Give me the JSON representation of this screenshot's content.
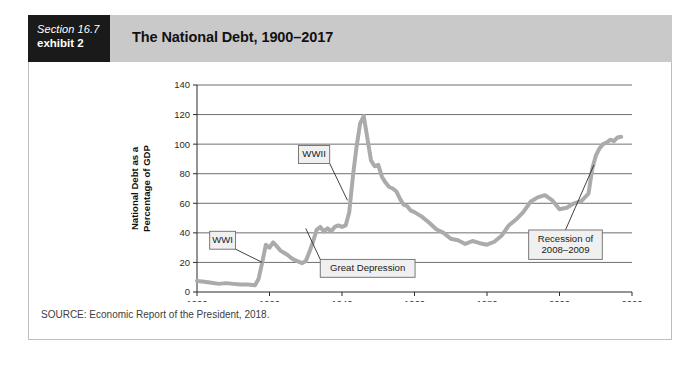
{
  "exhibit": {
    "section_label": "Section 16.7",
    "exhibit_label": "exhibit 2",
    "title": "The National Debt, 1900–2017",
    "source": "SOURCE: Economic Report of the President, 2018."
  },
  "colors": {
    "header_bar": "#c9c9c9",
    "tag_background": "#1a1a1a",
    "tag_text": "#ffffff",
    "line": "#ababab",
    "grid": "#4a4a4a",
    "callout_fill": "#f0f0f0",
    "callout_border": "#6b6b6b"
  },
  "chart_data": {
    "type": "line",
    "title": "The National Debt, 1900–2017",
    "xlabel": "",
    "ylabel": "National Debt as a Percentage of GDP",
    "ylabel_lines": [
      "National Debt as a",
      "Percentage of GDP"
    ],
    "xlim": [
      1900,
      2020
    ],
    "ylim": [
      0,
      140
    ],
    "ytick_values": [
      0,
      20,
      40,
      60,
      80,
      100,
      120,
      140
    ],
    "ytick_labels": [
      "0",
      "20",
      "40",
      "60",
      "80",
      "100",
      "120",
      "140"
    ],
    "xtick_values": [
      1900,
      1920,
      1940,
      1960,
      1980,
      2000,
      2020
    ],
    "xtick_labels": [
      "1900",
      "1920",
      "1940",
      "1960",
      "1980",
      "2000",
      "2020"
    ],
    "grid": "horizontal",
    "legend": "none",
    "series": [
      {
        "name": "National Debt as a Percentage of GDP",
        "x": [
          1900,
          1902,
          1904,
          1906,
          1908,
          1910,
          1912,
          1914,
          1916,
          1917,
          1918,
          1919,
          1920,
          1921,
          1922,
          1923,
          1924,
          1925,
          1926,
          1927,
          1928,
          1929,
          1930,
          1931,
          1932,
          1933,
          1934,
          1935,
          1936,
          1937,
          1938,
          1939,
          1940,
          1941,
          1942,
          1943,
          1944,
          1945,
          1946,
          1947,
          1948,
          1949,
          1950,
          1951,
          1952,
          1953,
          1954,
          1955,
          1956,
          1957,
          1958,
          1959,
          1960,
          1962,
          1964,
          1966,
          1968,
          1970,
          1972,
          1974,
          1976,
          1978,
          1980,
          1982,
          1984,
          1986,
          1988,
          1990,
          1992,
          1994,
          1996,
          1998,
          2000,
          2002,
          2004,
          2006,
          2008,
          2009,
          2010,
          2011,
          2012,
          2013,
          2014,
          2015,
          2016,
          2017
        ],
        "y": [
          7.5,
          7.0,
          6.3,
          5.5,
          6.0,
          5.5,
          5.0,
          5.0,
          4.5,
          9.0,
          20.0,
          32.0,
          30.0,
          33.5,
          31.0,
          28.0,
          26.5,
          25.0,
          23.0,
          21.5,
          20.5,
          19.5,
          21.0,
          27.0,
          34.0,
          42.0,
          44.0,
          41.0,
          43.0,
          41.0,
          44.0,
          45.0,
          44.0,
          45.0,
          54.0,
          78.0,
          98.0,
          114.0,
          119.0,
          104.0,
          89.0,
          85.0,
          86.0,
          78.0,
          74.0,
          71.0,
          70.0,
          68.0,
          63.0,
          59.0,
          58.0,
          55.0,
          54.0,
          51.0,
          47.0,
          42.5,
          40.0,
          36.0,
          35.0,
          32.5,
          34.5,
          33.0,
          32.0,
          34.0,
          38.0,
          45.0,
          49.0,
          54.0,
          61.0,
          64.0,
          65.5,
          62.0,
          56.0,
          57.0,
          60.0,
          61.5,
          66.5,
          83.0,
          92.0,
          97.0,
          100.0,
          101.0,
          103.0,
          102.0,
          104.5,
          105.0
        ]
      }
    ],
    "annotations": [
      {
        "id": "wwi",
        "lines": [
          "WWI"
        ],
        "box_x": 1903.5,
        "box_y": 35.0,
        "point_x": 1918.0,
        "point_y": 20.0
      },
      {
        "id": "wwii",
        "lines": [
          "WWII"
        ],
        "box_x": 1928.0,
        "box_y": 93.0,
        "point_x": 1941.5,
        "point_y": 62.0
      },
      {
        "id": "great-depression",
        "lines": [
          "Great Depression"
        ],
        "box_x": 1934.0,
        "box_y": 16.0,
        "point_x": 1930.0,
        "point_y": 43.0
      },
      {
        "id": "recession",
        "lines": [
          "Recession of",
          "2008–2009"
        ],
        "box_x": 1991.5,
        "box_y": 32.0,
        "point_x": 2009.5,
        "point_y": 86.0
      }
    ]
  }
}
